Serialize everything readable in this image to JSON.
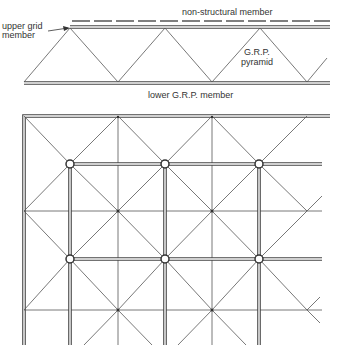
{
  "labels": {
    "non_structural": "non-structural member",
    "upper_grid_1": "upper grid",
    "upper_grid_2": "member",
    "pyramid_1": "G.R.P.",
    "pyramid_2": "pyramid",
    "lower_member": "lower G.R.P. member"
  },
  "elevation": {
    "upper_member": {
      "x1": 70,
      "x2": 330,
      "y": 27
    },
    "lower_member": {
      "x1": 24,
      "x2": 330,
      "y": 83
    },
    "apexes_x": [
      70,
      260
    ],
    "bases_x": [
      118,
      212,
      307
    ]
  },
  "plan": {
    "frame": {
      "x": 24,
      "y": 116,
      "right": 330,
      "bottom": 345
    },
    "node_spacing": 94.5,
    "grid_nodes": [
      [
        70,
        164
      ],
      [
        165,
        164
      ],
      [
        259,
        164
      ],
      [
        70,
        259
      ],
      [
        165,
        259
      ],
      [
        259,
        259
      ]
    ]
  }
}
